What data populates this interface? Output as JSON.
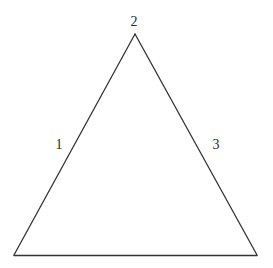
{
  "diagram": {
    "type": "triangle",
    "stroke_color": "#333333",
    "background": "#ffffff",
    "vertices": {
      "apex": {
        "x": 135,
        "y": 34
      },
      "bottom_left": {
        "x": 14,
        "y": 255
      },
      "bottom_right": {
        "x": 257,
        "y": 255
      }
    },
    "labels": [
      {
        "id": "label-1",
        "text": "1",
        "x": 59,
        "y": 145,
        "refers_to": "left-edge"
      },
      {
        "id": "label-2",
        "text": "2",
        "x": 134,
        "y": 22,
        "refers_to": "apex"
      },
      {
        "id": "label-3",
        "text": "3",
        "x": 216,
        "y": 145,
        "refers_to": "right-edge"
      }
    ]
  }
}
